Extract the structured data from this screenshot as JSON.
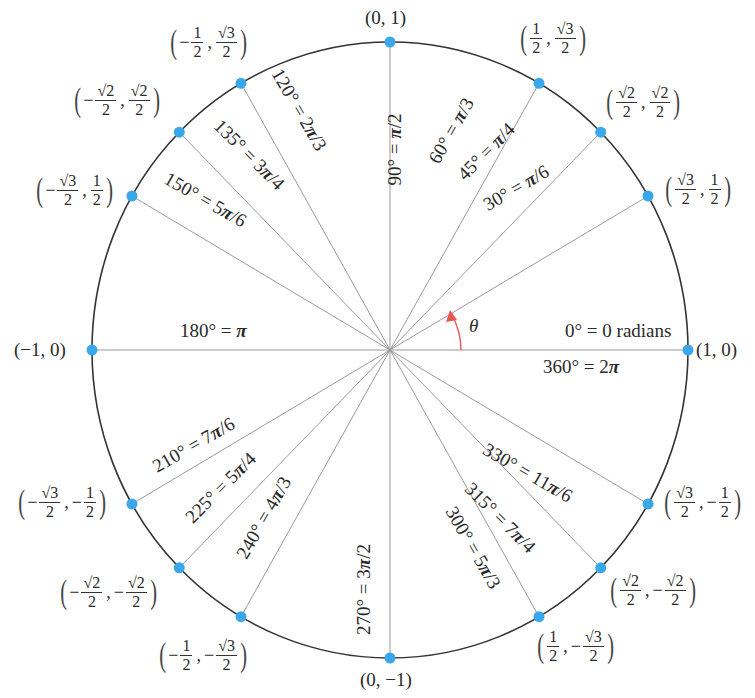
{
  "diagram": {
    "center_px": [
      390,
      350
    ],
    "colors": {
      "point": "#3aa7ea",
      "circle": "#333333",
      "ray": "#9a9a9a",
      "arc": "#e8574f"
    },
    "theta_symbol": "θ",
    "points": [
      {
        "deg": 0,
        "angle_label": "0° = 0 radians",
        "angle_label_2": "360° = 2π",
        "x": "1",
        "y": "0"
      },
      {
        "deg": 30,
        "angle_label": "30° = π/6",
        "x": "√3/2",
        "y": "1/2"
      },
      {
        "deg": 45,
        "angle_label": "45° = π/4",
        "x": "√2/2",
        "y": "√2/2"
      },
      {
        "deg": 60,
        "angle_label": "60° = π/3",
        "x": "1/2",
        "y": "√3/2"
      },
      {
        "deg": 90,
        "angle_label": "90° = π/2",
        "x": "0",
        "y": "1"
      },
      {
        "deg": 120,
        "angle_label": "120° = 2π/3",
        "x": "−1/2",
        "y": "√3/2"
      },
      {
        "deg": 135,
        "angle_label": "135° = 3π/4",
        "x": "−√2/2",
        "y": "√2/2"
      },
      {
        "deg": 150,
        "angle_label": "150° = 5π/6",
        "x": "−√3/2",
        "y": "1/2"
      },
      {
        "deg": 180,
        "angle_label": "180° = π",
        "x": "−1",
        "y": "0"
      },
      {
        "deg": 210,
        "angle_label": "210° = 7π/6",
        "x": "−√3/2",
        "y": "−1/2"
      },
      {
        "deg": 225,
        "angle_label": "225° = 5π/4",
        "x": "−√2/2",
        "y": "−√2/2"
      },
      {
        "deg": 240,
        "angle_label": "240° = 4π/3",
        "x": "−1/2",
        "y": "−√3/2"
      },
      {
        "deg": 270,
        "angle_label": "270° = 3π/2",
        "x": "0",
        "y": "−1"
      },
      {
        "deg": 300,
        "angle_label": "300° = 5π/3",
        "x": "1/2",
        "y": "−√3/2"
      },
      {
        "deg": 315,
        "angle_label": "315° = 7π/4",
        "x": "√2/2",
        "y": "−√2/2"
      },
      {
        "deg": 330,
        "angle_label": "330° = 11π/6",
        "x": "√3/2",
        "y": "−1/2"
      }
    ],
    "angle_labels": {
      "a0": "0° = 0 radians",
      "a360": "360° = 2",
      "a30": "30° = ",
      "a30r": "π",
      "a30s": "/6",
      "a45": "45° = ",
      "a45r": "π",
      "a45s": "/4",
      "a60": "60° = ",
      "a60r": "π",
      "a60s": "/3",
      "a90": "90° = ",
      "a90r": "π",
      "a90s": "/2",
      "a120": "120° = 2",
      "a120r": "π",
      "a120s": "/3",
      "a135": "135° = 3",
      "a135r": "π",
      "a135s": "/4",
      "a150": "150° = 5",
      "a150r": "π",
      "a150s": "/6",
      "a180": "180° = ",
      "a180r": "π",
      "a210": "210° = 7",
      "a210r": "π",
      "a210s": "/6",
      "a225": "225° = 5",
      "a225r": "π",
      "a225s": "/4",
      "a240": "240° = 4",
      "a240r": "π",
      "a240s": "/3",
      "a270": "270° = 3",
      "a270r": "π",
      "a270s": "/2",
      "a300": "300° = 5",
      "a300r": "π",
      "a300s": "/3",
      "a315": "315° = 7",
      "a315r": "π",
      "a315s": "/4",
      "a330": "330° = 11",
      "a330r": "π",
      "a330s": "/6",
      "pi": "π"
    },
    "coord_labels": {
      "p0": "(1, 0)",
      "p90": "(0, 1)",
      "p180": "(−1, 0)",
      "p270": "(0, −1)",
      "sqrt3": "√3",
      "sqrt2": "√2",
      "one": "1",
      "two": "2",
      "minus": "−",
      "comma": ",",
      "lparen": "(",
      "rparen": ")"
    }
  }
}
